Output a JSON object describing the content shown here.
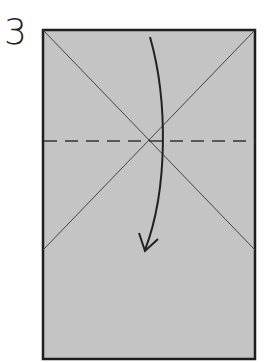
{
  "diagram": {
    "step_number": "3",
    "paper": {
      "fill": "#c4c4c4",
      "border": "#1e1e1e",
      "x": 42,
      "y": 29,
      "width": 214,
      "height": 331
    },
    "crease_lines": [
      {
        "type": "diagonal",
        "from": [
          42,
          29
        ],
        "to": [
          256,
          220
        ]
      },
      {
        "type": "diagonal",
        "from": [
          256,
          29
        ],
        "to": [
          42,
          245
        ]
      }
    ],
    "fold_line": {
      "type": "valley-fold-dashed",
      "y": 141,
      "color": "#333333"
    },
    "arrow": {
      "direction": "down",
      "meaning": "fold top edge down along dashed line"
    }
  }
}
